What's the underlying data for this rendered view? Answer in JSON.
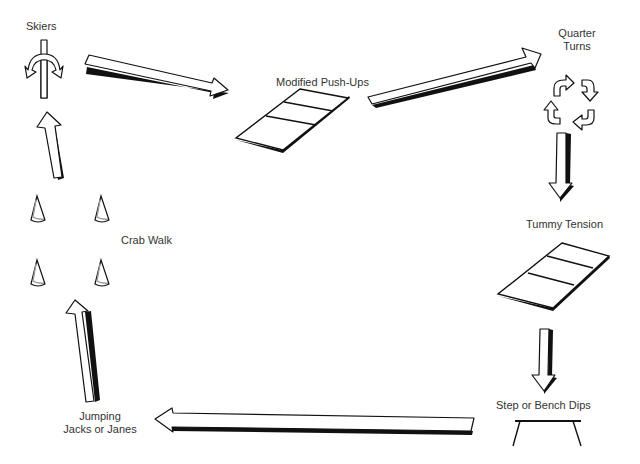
{
  "diagram": {
    "type": "exercise-circuit",
    "colors": {
      "line": "#111111",
      "text": "#333333",
      "background": "#ffffff",
      "cone_shade": "#999999"
    },
    "stations": [
      {
        "id": "skiers",
        "label": "Skiers",
        "icon": "split-arrow-icon"
      },
      {
        "id": "push-ups",
        "label": "Modified Push-Ups",
        "icon": "mat-icon"
      },
      {
        "id": "quarter-turns",
        "label_line1": "Quarter",
        "label_line2": "Turns",
        "icon": "rotate-arrows-icon"
      },
      {
        "id": "tummy-tension",
        "label": "Tummy Tension",
        "icon": "mat-icon"
      },
      {
        "id": "bench-dips",
        "label": "Step or Bench Dips",
        "icon": "bench-icon"
      },
      {
        "id": "jumping-jacks",
        "label_line1": "Jumping",
        "label_line2": "Jacks or Janes",
        "icon": "none"
      },
      {
        "id": "crab-walk",
        "label": "Crab Walk",
        "icon": "cones-icon"
      }
    ],
    "flow": [
      "Skiers",
      "Modified Push-Ups",
      "Quarter Turns",
      "Tummy Tension",
      "Step or Bench Dips",
      "Jumping Jacks or Janes",
      "Crab Walk",
      "Skiers"
    ]
  }
}
